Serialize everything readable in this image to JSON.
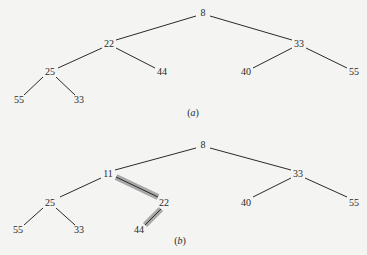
{
  "diagrams": [
    {
      "id": "a",
      "caption": "(a)",
      "caption_pos": [
        193,
        112
      ],
      "nodes": [
        {
          "id": "n0",
          "label": "8",
          "x": 203,
          "y": 13
        },
        {
          "id": "n1",
          "label": "22",
          "x": 109,
          "y": 44
        },
        {
          "id": "n2",
          "label": "33",
          "x": 299,
          "y": 44
        },
        {
          "id": "n3",
          "label": "25",
          "x": 50,
          "y": 72
        },
        {
          "id": "n4",
          "label": "44",
          "x": 162,
          "y": 72
        },
        {
          "id": "n5",
          "label": "40",
          "x": 246,
          "y": 72
        },
        {
          "id": "n6",
          "label": "55",
          "x": 354,
          "y": 72
        },
        {
          "id": "n7",
          "label": "55",
          "x": 19,
          "y": 100
        },
        {
          "id": "n8",
          "label": "33",
          "x": 79,
          "y": 100
        }
      ],
      "edges": [
        {
          "from": [
            196,
            16
          ],
          "to": [
            116,
            40
          ]
        },
        {
          "from": [
            210,
            16
          ],
          "to": [
            292,
            40
          ]
        },
        {
          "from": [
            102,
            48
          ],
          "to": [
            58,
            68
          ]
        },
        {
          "from": [
            116,
            48
          ],
          "to": [
            155,
            68
          ]
        },
        {
          "from": [
            292,
            48
          ],
          "to": [
            253,
            68
          ]
        },
        {
          "from": [
            306,
            48
          ],
          "to": [
            347,
            68
          ]
        },
        {
          "from": [
            43,
            77
          ],
          "to": [
            24,
            95
          ]
        },
        {
          "from": [
            56,
            77
          ],
          "to": [
            75,
            95
          ]
        }
      ],
      "highlighted_edges": []
    },
    {
      "id": "b",
      "caption": "(b)",
      "caption_pos": [
        180,
        240
      ],
      "nodes": [
        {
          "id": "m0",
          "label": "8",
          "x": 203,
          "y": 145
        },
        {
          "id": "m1",
          "label": "11",
          "x": 108,
          "y": 174
        },
        {
          "id": "m2",
          "label": "33",
          "x": 298,
          "y": 174
        },
        {
          "id": "m3",
          "label": "25",
          "x": 50,
          "y": 203
        },
        {
          "id": "m4",
          "label": "22",
          "x": 164,
          "y": 203
        },
        {
          "id": "m5",
          "label": "40",
          "x": 246,
          "y": 203
        },
        {
          "id": "m6",
          "label": "55",
          "x": 354,
          "y": 203
        },
        {
          "id": "m7",
          "label": "55",
          "x": 18,
          "y": 230
        },
        {
          "id": "m8",
          "label": "33",
          "x": 79,
          "y": 230
        },
        {
          "id": "m9",
          "label": "44",
          "x": 139,
          "y": 230
        }
      ],
      "edges": [
        {
          "from": [
            196,
            148
          ],
          "to": [
            115,
            170
          ]
        },
        {
          "from": [
            210,
            148
          ],
          "to": [
            291,
            170
          ]
        },
        {
          "from": [
            101,
            178
          ],
          "to": [
            60,
            197
          ]
        },
        {
          "from": [
            291,
            178
          ],
          "to": [
            253,
            197
          ]
        },
        {
          "from": [
            305,
            178
          ],
          "to": [
            347,
            197
          ]
        },
        {
          "from": [
            43,
            208
          ],
          "to": [
            24,
            225
          ]
        },
        {
          "from": [
            56,
            208
          ],
          "to": [
            75,
            225
          ]
        }
      ],
      "highlighted_edges": [
        {
          "from": [
            116,
            177
          ],
          "to": [
            158,
            197
          ]
        },
        {
          "from": [
            161,
            209
          ],
          "to": [
            145,
            225
          ]
        }
      ]
    }
  ],
  "colors": {
    "background": "#f4f4f2",
    "edge": "#2a2a2a",
    "highlight": "#a8a8a8"
  }
}
